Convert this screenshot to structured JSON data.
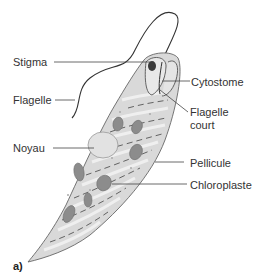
{
  "figure": {
    "panel_label": "a)",
    "labels": {
      "stigma": "Stigma",
      "flagelle": "Flagelle",
      "noyau": "Noyau",
      "cytostome": "Cytostome",
      "flagelle_court_1": "Flagelle",
      "flagelle_court_2": "court",
      "pellicule": "Pellicule",
      "chloroplaste": "Chloroplaste"
    },
    "colors": {
      "body_fill": "#d9d9d9",
      "body_highlight": "#eeeeee",
      "chloroplast": "#8c8c8c",
      "nucleus": "#e2e2e2",
      "stigma": "#3a3a3a",
      "outline": "#555555",
      "leader_line": "#444444"
    }
  }
}
